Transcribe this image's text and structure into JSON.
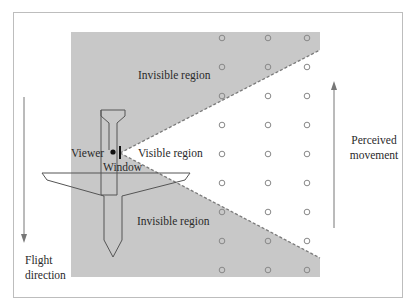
{
  "diagram": {
    "labels": {
      "invisible_top": "Invisible region",
      "invisible_bottom": "Invisible region",
      "visible": "Visible region",
      "viewer": "Viewer",
      "window": "Window",
      "perceived_line1": "Perceived",
      "perceived_line2": "movement",
      "flight_line1": "Flight",
      "flight_line2": "direction"
    },
    "colors": {
      "invisible_fill": "#c8c8c8",
      "frame": "#bdbdbd",
      "outline": "#555555",
      "dashed_edge": "#7a7a7a",
      "circle": "#888888"
    },
    "grid_points": {
      "columns_x": [
        222,
        268,
        307
      ],
      "rows_y": [
        38,
        67,
        96,
        125,
        154,
        183,
        212,
        241,
        270
      ]
    }
  }
}
